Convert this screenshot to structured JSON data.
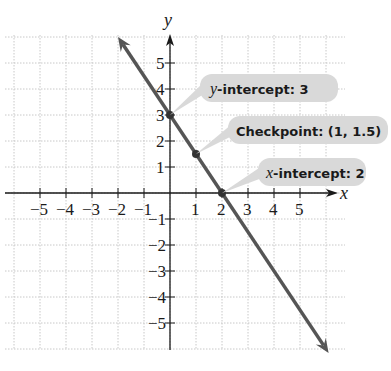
{
  "chart_data": {
    "type": "line",
    "title": "",
    "xlabel": "x",
    "ylabel": "y",
    "xlim": [
      -6.4,
      6.6
    ],
    "ylim": [
      -6.0,
      6.0
    ],
    "grid": true,
    "x_ticks": [
      -5,
      -4,
      -3,
      -2,
      -1,
      1,
      2,
      3,
      4,
      5
    ],
    "y_ticks": [
      -5,
      -4,
      -3,
      -2,
      -1,
      1,
      2,
      3,
      4,
      5
    ],
    "x_tick_labels": [
      "−5",
      "−4",
      "−3",
      "−2",
      "−1",
      "1",
      "2",
      "3",
      "4",
      "5"
    ],
    "y_tick_labels": [
      "−5",
      "−4",
      "−3",
      "−2",
      "−1",
      "1",
      "2",
      "3",
      "4",
      "5"
    ],
    "series": [
      {
        "name": "line",
        "equation": "y = -1.5x + 3",
        "color": "#555555",
        "arrows": "both ends",
        "x": [
          -2,
          6.1
        ],
        "y": [
          6,
          -6.15
        ]
      }
    ],
    "points": [
      {
        "x": 0,
        "y": 3,
        "label_prefix_italic": "y",
        "label_rest": "-intercept: 3"
      },
      {
        "x": 1,
        "y": 1.5,
        "label_prefix_italic": "",
        "label_rest": "Checkpoint: (1, 1.5)"
      },
      {
        "x": 2,
        "y": 0,
        "label_prefix_italic": "x",
        "label_rest": "-intercept: 2"
      }
    ],
    "annotations": [
      "y-intercept: 3",
      "Checkpoint: (1, 1.5)",
      "x-intercept: 2"
    ]
  },
  "colors": {
    "grid": "#c8c8c8",
    "axis": "#1a1a1a",
    "line": "#555555",
    "point": "#333333",
    "callout_bg": "#d9d9d9"
  }
}
